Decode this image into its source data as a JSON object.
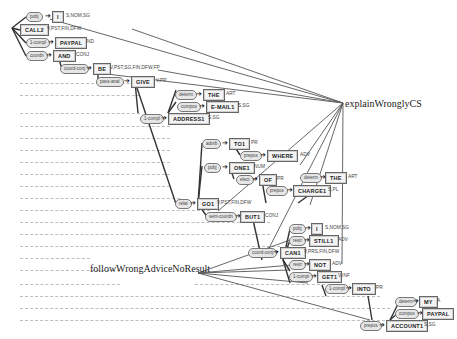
{
  "diagram": {
    "type": "dependency-parse-tree",
    "annotations": [
      {
        "id": "a1",
        "text": "explainWronglyCS"
      },
      {
        "id": "a2",
        "text": "followWrongAdviceNoResult"
      }
    ],
    "nodes": [
      {
        "id": "n_i1",
        "rel": "pobj",
        "word": "I",
        "tag": "S,NOM,SG"
      },
      {
        "id": "n_call2",
        "rel": "",
        "word": "CALL2",
        "tag": "V,PST,FIN,DFW"
      },
      {
        "id": "n_paypal1",
        "rel": "1-compl",
        "word": "PAYPAL",
        "tag": "ND"
      },
      {
        "id": "n_and",
        "rel": "coordn",
        "word": "AND",
        "tag": "CONJ"
      },
      {
        "id": "n_be",
        "rel": "coord-conj",
        "word": "BE",
        "tag": "V,PST,SG,FIN,DFW,FP"
      },
      {
        "id": "n_give",
        "rel": "pass-anal",
        "word": "GIVE",
        "tag": "V,PP"
      },
      {
        "id": "n_the1",
        "rel": "determ",
        "word": "THE",
        "tag": "ART"
      },
      {
        "id": "n_email",
        "rel": "compos",
        "word": "E-MAIL1",
        "tag": "S,SG"
      },
      {
        "id": "n_address",
        "rel": "1-compl",
        "word": "ADDRESS1",
        "tag": "S,SG"
      },
      {
        "id": "n_to1",
        "rel": "advrb",
        "word": "TO1",
        "tag": "PR"
      },
      {
        "id": "n_where",
        "rel": "prepos",
        "word": "WHERE",
        "tag": "ADV"
      },
      {
        "id": "n_one1",
        "rel": "pobj",
        "word": "ONE1",
        "tag": "NUM"
      },
      {
        "id": "n_of",
        "rel": "elect",
        "word": "OF",
        "tag": "PR"
      },
      {
        "id": "n_the2",
        "rel": "determ",
        "word": "THE",
        "tag": "ART"
      },
      {
        "id": "n_charge",
        "rel": "prepos",
        "word": "CHARGE1",
        "tag": "S,PL"
      },
      {
        "id": "n_go1",
        "rel": "relat",
        "word": "GO1",
        "tag": "V,PST,FIN,DFW"
      },
      {
        "id": "n_but1",
        "rel": "sent-coordn",
        "word": "BUT1",
        "tag": "CONJ"
      },
      {
        "id": "n_i2",
        "rel": "pobj",
        "word": "I",
        "tag": "S,NOM,SG"
      },
      {
        "id": "n_still",
        "rel": "restr",
        "word": "STILL1",
        "tag": "ADV"
      },
      {
        "id": "n_can1",
        "rel": "coord-conj",
        "word": "CAN1",
        "tag": "V,PRS,FIN,DFW"
      },
      {
        "id": "n_not",
        "rel": "restr",
        "word": "NOT",
        "tag": "ADV"
      },
      {
        "id": "n_get1",
        "rel": "1-compl",
        "word": "GET1",
        "tag": "V,INF"
      },
      {
        "id": "n_into",
        "rel": "1-compl",
        "word": "INTO",
        "tag": "PR"
      },
      {
        "id": "n_my",
        "rel": "determ",
        "word": "MY",
        "tag": "A"
      },
      {
        "id": "n_paypal2",
        "rel": "compos",
        "word": "PAYPAL",
        "tag": ""
      },
      {
        "id": "n_account",
        "rel": "prepos",
        "word": "ACCOUNT1",
        "tag": "S,SG"
      }
    ]
  }
}
